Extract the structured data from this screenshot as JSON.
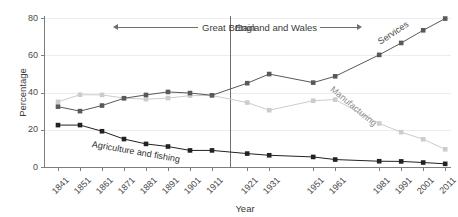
{
  "chart_data": {
    "type": "line",
    "title": "",
    "xlabel": "Year",
    "ylabel": "Percentage",
    "ylim": [
      0,
      80
    ],
    "yticks": [
      0,
      20,
      40,
      60,
      80
    ],
    "grid": true,
    "legend_position": "inline-labels",
    "x": [
      "1841",
      "1851",
      "1861",
      "1871",
      "1881",
      "1891",
      "1901",
      "1911",
      "1921",
      "1931",
      "1951",
      "1961",
      "1981",
      "1991",
      "2001",
      "2011"
    ],
    "categories": [
      "1841",
      "1851",
      "1861",
      "1871",
      "1881",
      "1891",
      "1901",
      "1911",
      "1921",
      "1931",
      "1951",
      "1961",
      "1981",
      "1991",
      "2001",
      "2011"
    ],
    "series": [
      {
        "name": "Agriculture and fishing",
        "color": "#222222",
        "values": [
          22.5,
          22.5,
          19.2,
          15.0,
          12.4,
          11.0,
          8.9,
          8.9,
          7.2,
          6.3,
          5.4,
          4.0,
          3.1,
          3.0,
          2.4,
          1.7
        ]
      },
      {
        "name": "Manufacturing",
        "color": "#cccccc",
        "values": [
          35.0,
          38.8,
          38.7,
          37.0,
          36.4,
          37.0,
          38.3,
          38.4,
          34.6,
          30.5,
          35.6,
          36.2,
          23.4,
          18.7,
          14.9,
          9.5
        ]
      },
      {
        "name": "Services",
        "color": "#595959",
        "values": [
          32.4,
          30.0,
          33.0,
          36.9,
          38.7,
          40.3,
          39.7,
          38.5,
          45.0,
          49.9,
          45.3,
          48.7,
          60.2,
          66.6,
          73.4,
          79.7
        ]
      }
    ],
    "annotations": {
      "region_left": "Great Britain",
      "region_right": "England and Wales"
    }
  },
  "axes": {
    "y_title": "Percentage",
    "x_title": "Year",
    "y_tick_labels": [
      "80",
      "60",
      "40",
      "20",
      "0"
    ]
  },
  "series_labels": {
    "agriculture": "Agriculture and fishing",
    "manufacturing": "Manufacturing",
    "services": "Services"
  },
  "regions": {
    "left": "Great Britain",
    "right": "England and Wales"
  }
}
